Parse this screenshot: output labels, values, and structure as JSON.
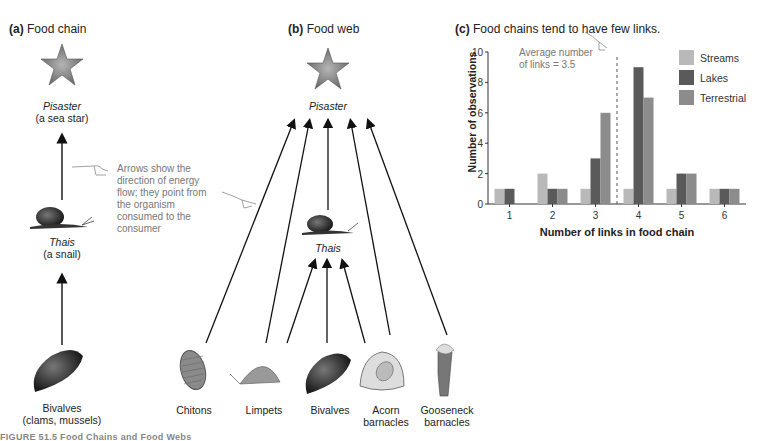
{
  "panel_a": {
    "title_prefix": "(a)",
    "title": "Food chain",
    "top": {
      "name": "Pisaster",
      "desc": "(a sea star)"
    },
    "middle": {
      "name": "Thais",
      "desc": "(a snail)"
    },
    "bottom": {
      "line1": "Bivalves",
      "line2": "(clams, mussels)"
    },
    "note": [
      "Arrows show the",
      "direction of energy",
      "flow; they point from",
      "the organism",
      "consumed to the",
      "consumer"
    ]
  },
  "panel_b": {
    "title_prefix": "(b)",
    "title": "Food web",
    "top": "Pisaster",
    "middle": "Thais",
    "prey": [
      {
        "line1": "Chitons",
        "line2": ""
      },
      {
        "line1": "Limpets",
        "line2": ""
      },
      {
        "line1": "Bivalves",
        "line2": ""
      },
      {
        "line1": "Acorn",
        "line2": "barnacles"
      },
      {
        "line1": "Gooseneck",
        "line2": "barnacles"
      }
    ]
  },
  "panel_c": {
    "title_prefix": "(c)",
    "title": "Food chains tend to have few links.",
    "annotation": [
      "Average number",
      "of links = 3.5"
    ]
  },
  "caption": "FIGURE 51.5 Food Chains and Food Webs",
  "colors": {
    "streams": "#b9b9b9",
    "lakes": "#5a5a5a",
    "terrestrial": "#8c8c8c"
  },
  "chart_data": {
    "type": "bar",
    "title": "Food chains tend to have few links.",
    "xlabel": "Number of links in food chain",
    "ylabel": "Number of observations",
    "categories": [
      "1",
      "2",
      "3",
      "4",
      "5",
      "6"
    ],
    "series": [
      {
        "name": "Streams",
        "values": [
          1,
          2,
          1,
          1,
          1,
          1
        ]
      },
      {
        "name": "Lakes",
        "values": [
          1,
          1,
          3,
          9,
          2,
          1
        ]
      },
      {
        "name": "Terrestrial",
        "values": [
          0,
          1,
          6,
          7,
          2,
          1
        ]
      }
    ],
    "ylim": [
      0,
      10
    ],
    "yticks": [
      0,
      2,
      4,
      6,
      8,
      10
    ],
    "average_line": 3.5,
    "legend_position": "top-right",
    "grid": false
  }
}
